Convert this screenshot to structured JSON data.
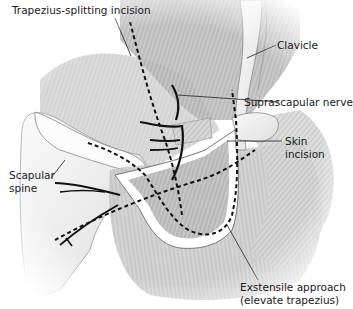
{
  "figure": {
    "type": "anatomical-illustration",
    "colors": {
      "background": "#ffffff",
      "muscle_shade": "#8a8a8a",
      "muscle_light": "#cfcfcf",
      "bone": "#f4f4f4",
      "ink": "#111111"
    }
  },
  "labels": {
    "trapezius_splitting": "Trapezius-splitting incision",
    "clavicle": "Clavicle",
    "suprascapular_nerve": "Suprascapular nerve",
    "skin_incision_line1": "Skin",
    "skin_incision_line2": "incision",
    "scapular_spine_line1": "Scapular",
    "scapular_spine_line2": "spine",
    "extensile_line1": "Exstensile approach",
    "extensile_line2": "(elevate trapezius)"
  }
}
